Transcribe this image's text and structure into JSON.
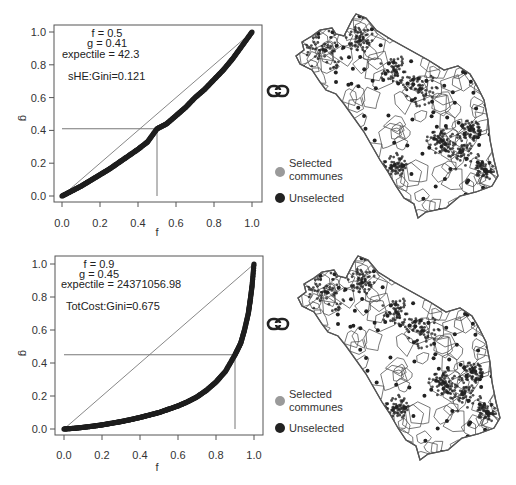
{
  "chart_data": [
    {
      "type": "scatter",
      "subtype": "lorenz-curve",
      "title": "",
      "xlabel": "f",
      "ylabel": "g",
      "xlim": [
        0,
        1
      ],
      "ylim": [
        0,
        1
      ],
      "xticks": [
        "0.0",
        "0.2",
        "0.4",
        "0.6",
        "0.8",
        "1.0"
      ],
      "yticks": [
        "0.0",
        "0.2",
        "0.4",
        "0.6",
        "0.8",
        "1.0"
      ],
      "grid": false,
      "annotations": {
        "f_line": "f = 0.5",
        "g_line": "g = 0.41",
        "expectile_line": "expectile = 42.3",
        "gini_line": "sHE:Gini=0.121"
      },
      "marker": {
        "f": 0.5,
        "g": 0.41
      },
      "gini": 0.121,
      "series": [
        {
          "name": "Lorenz curve",
          "x": [
            0.0,
            0.05,
            0.1,
            0.15,
            0.2,
            0.25,
            0.3,
            0.35,
            0.4,
            0.45,
            0.5,
            0.55,
            0.6,
            0.65,
            0.7,
            0.75,
            0.8,
            0.85,
            0.9,
            0.95,
            1.0
          ],
          "y": [
            0.0,
            0.03,
            0.06,
            0.095,
            0.13,
            0.165,
            0.205,
            0.245,
            0.285,
            0.33,
            0.41,
            0.44,
            0.49,
            0.54,
            0.6,
            0.65,
            0.71,
            0.77,
            0.84,
            0.92,
            1.0
          ]
        },
        {
          "name": "Equality line",
          "x": [
            0,
            1
          ],
          "y": [
            0,
            1
          ]
        }
      ]
    },
    {
      "type": "scatter",
      "subtype": "lorenz-curve",
      "title": "",
      "xlabel": "f",
      "ylabel": "g",
      "xlim": [
        0,
        1
      ],
      "ylim": [
        0,
        1
      ],
      "xticks": [
        "0.0",
        "0.2",
        "0.4",
        "0.6",
        "0.8",
        "1.0"
      ],
      "yticks": [
        "0.0",
        "0.2",
        "0.4",
        "0.6",
        "0.8",
        "1.0"
      ],
      "grid": false,
      "annotations": {
        "f_line": "f = 0.9",
        "g_line": "g = 0.45",
        "expectile_line": "expectile = 24371056.98",
        "gini_line": "TotCost:Gini=0.675"
      },
      "marker": {
        "f": 0.9,
        "g": 0.45
      },
      "gini": 0.675,
      "series": [
        {
          "name": "Lorenz curve",
          "x": [
            0.0,
            0.05,
            0.1,
            0.15,
            0.2,
            0.25,
            0.3,
            0.35,
            0.4,
            0.45,
            0.5,
            0.55,
            0.6,
            0.65,
            0.7,
            0.75,
            0.8,
            0.85,
            0.9,
            0.93,
            0.95,
            0.97,
            0.98,
            0.99,
            1.0
          ],
          "y": [
            0.0,
            0.004,
            0.01,
            0.017,
            0.025,
            0.035,
            0.045,
            0.057,
            0.07,
            0.085,
            0.1,
            0.12,
            0.14,
            0.165,
            0.195,
            0.235,
            0.285,
            0.35,
            0.45,
            0.52,
            0.6,
            0.7,
            0.78,
            0.87,
            1.0
          ]
        },
        {
          "name": "Equality line",
          "x": [
            0,
            1
          ],
          "y": [
            0,
            1
          ]
        }
      ]
    }
  ],
  "maps": [
    {
      "link_icon": "link-icon",
      "legend": {
        "selected_line1": "Selected",
        "selected_line2": "communes",
        "unselected": "Unselected"
      },
      "colors": {
        "selected": "#9a9a9a",
        "unselected": "#222222",
        "boundary": "#555555"
      }
    },
    {
      "link_icon": "link-icon",
      "legend": {
        "selected_line1": "Selected",
        "selected_line2": "communes",
        "unselected": "Unselected"
      },
      "colors": {
        "selected": "#9a9a9a",
        "unselected": "#222222",
        "boundary": "#555555"
      }
    }
  ]
}
